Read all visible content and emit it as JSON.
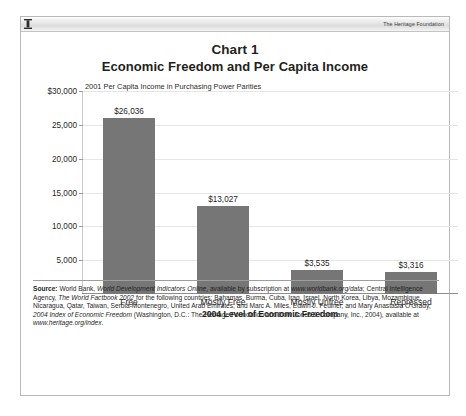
{
  "header": {
    "icon": "document-marker-icon",
    "brand": "The Heritage Foundation"
  },
  "title": {
    "chart_number": "Chart 1",
    "chart_title": "Economic Freedom and Per Capita Income"
  },
  "colors": {
    "bar_fill": "#767676",
    "axis": "#8d8d8d",
    "gridline": "#e6e6e6",
    "text": "#1f1f1f",
    "panel_border": "#b9b9b9"
  },
  "chart_data": {
    "type": "bar",
    "title": "Economic Freedom and Per Capita Income",
    "subtitle": "2001  Per Capita Income in Purchasing Power Parities",
    "xlabel": "2004 Level of Economic Freedom",
    "ylabel": "",
    "categories": [
      "Free",
      "Mostly Free",
      "Mostly Unfree",
      "Repressed"
    ],
    "values": [
      26036,
      13027,
      3535,
      3316
    ],
    "value_labels": [
      "$26,036",
      "$13,027",
      "$3,535",
      "$3,316"
    ],
    "ylim": [
      0,
      30000
    ],
    "yticks": [
      5000,
      10000,
      15000,
      20000,
      25000,
      30000
    ],
    "ytick_labels": [
      "5,000",
      "10,000",
      "15,000",
      "20,000",
      "25,000",
      "$30,000"
    ],
    "grid": true,
    "legend": "none"
  },
  "source": {
    "label": "Source:",
    "line1_a": " World Bank, ",
    "line1_i": "World Development Indicators Online",
    "line1_b": ", available by subscription at ",
    "line1_url": "www.worldbank.org/data",
    "line1_c": ";",
    "line2_a": "Central Intelligence Agency, ",
    "line2_i": "The World Factbook 2002",
    "line2_b": " for the following countries: Bahamas, Burma, Cuba, Iraq, Israel,",
    "line3": "North Korea, Libya, Mozambique, Nicaragua, Qatar, Taiwan, Serbia-Montenegro, United Arab Emirates; and Marc A.",
    "line4_a": "Miles, Edwin J. Feulner, and Mary Anastasia O'Grady, ",
    "line4_i": "2004 Index of Economic Freedom",
    "line4_b": " (Washington, D.C.: The Heritage",
    "line5_a": "Foundation and Dow Jones & Company, Inc., 2004), available at ",
    "line5_url": "www.heritage.org/index",
    "line5_b": "."
  }
}
